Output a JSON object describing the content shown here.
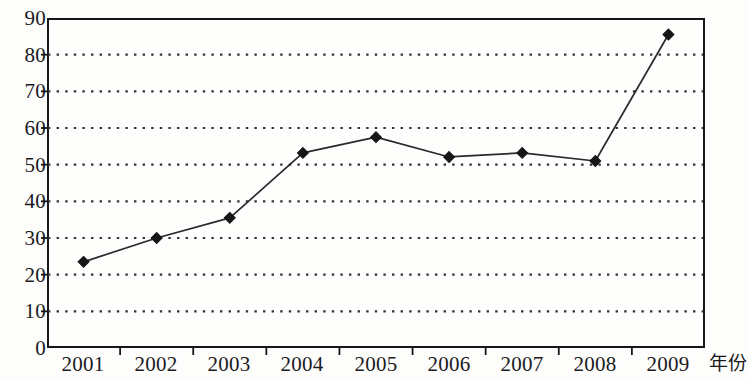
{
  "chart_data": {
    "type": "line",
    "title": "",
    "subtitle": "",
    "xlabel": "年份",
    "ylabel": "",
    "categories": [
      "2001",
      "2002",
      "2003",
      "2004",
      "2005",
      "2006",
      "2007",
      "2008",
      "2009"
    ],
    "values": [
      23.5,
      30,
      35.5,
      53.2,
      57.5,
      52.1,
      53.2,
      51,
      85.5
    ],
    "series": [
      {
        "name": "",
        "values": [
          23.5,
          30,
          35.5,
          53.2,
          57.5,
          52.1,
          53.2,
          51,
          85.5
        ]
      }
    ],
    "ylim": [
      0,
      90
    ],
    "ytick_step": 10,
    "yticks": [
      0,
      10,
      20,
      30,
      40,
      50,
      60,
      70,
      80,
      90
    ],
    "ytick_labels": [
      "0",
      "10",
      "20",
      "30",
      "40",
      "50",
      "60",
      "70",
      "80",
      "90"
    ],
    "xtick_labels": [
      "2001",
      "2002",
      "2003",
      "2004",
      "2005",
      "2006",
      "2007",
      "2008",
      "2009"
    ],
    "grid": true,
    "grid_style": "dotted-horizontal",
    "legend": false,
    "legend_position": "none",
    "marker": "diamond",
    "line_color": "#2a2a2d",
    "marker_color": "#161618",
    "grid_color": "#33333a",
    "axis_color": "#17171a",
    "plot_background": "#fefefc"
  },
  "axes": {
    "x_axis_name": "年份",
    "y_axis_name": ""
  }
}
